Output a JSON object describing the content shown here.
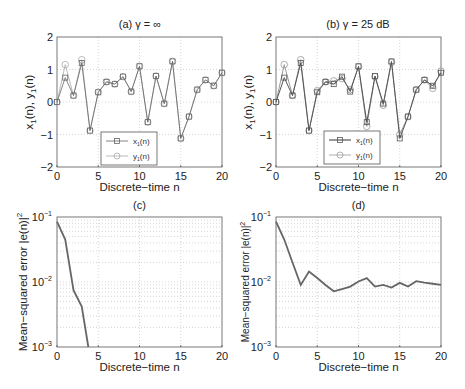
{
  "chart_data": [
    {
      "id": "a",
      "type": "line",
      "title": "(a) γ = ∞",
      "xlabel": "Discrete−time n",
      "ylabel": "x1(n), y1(n)",
      "xlim": [
        0,
        20
      ],
      "ylim": [
        -2,
        2
      ],
      "xticks": [
        0,
        5,
        10,
        15,
        20
      ],
      "yticks": [
        -2,
        -1,
        0,
        1,
        2
      ],
      "grid": true,
      "legend": {
        "position": "lower center",
        "entries": [
          "x1(n)",
          "y1(n)"
        ]
      },
      "x": [
        0,
        1,
        2,
        3,
        4,
        5,
        6,
        7,
        8,
        9,
        10,
        11,
        12,
        13,
        14,
        15,
        16,
        17,
        18,
        19,
        20
      ],
      "series": [
        {
          "name": "x1(n)",
          "marker": "square",
          "color": "#666666",
          "values": [
            0,
            0.75,
            0.2,
            1.2,
            -0.88,
            0.3,
            0.62,
            0.55,
            0.78,
            0.32,
            1.1,
            -0.62,
            0.8,
            -0.05,
            1.25,
            -1.12,
            -0.45,
            0.38,
            0.68,
            0.5,
            0.9
          ]
        },
        {
          "name": "y1(n)",
          "marker": "circle",
          "color": "#aaaaaa",
          "values": [
            0,
            1.15,
            0.2,
            1.3,
            -0.88,
            0.3,
            0.62,
            0.55,
            0.78,
            0.32,
            1.1,
            -0.62,
            0.8,
            -0.05,
            1.25,
            -1.12,
            -0.45,
            0.38,
            0.68,
            0.5,
            0.9
          ]
        }
      ]
    },
    {
      "id": "b",
      "type": "line",
      "title": "(b) γ = 25 dB",
      "xlabel": "Discrete−time n",
      "ylabel": "x1(n), y1(n)",
      "xlim": [
        0,
        20
      ],
      "ylim": [
        -2,
        2
      ],
      "xticks": [
        0,
        5,
        10,
        15,
        20
      ],
      "yticks": [
        -2,
        -1,
        0,
        1,
        2
      ],
      "grid": true,
      "legend": {
        "position": "lower center",
        "entries": [
          "x1(n)",
          "y1(n)"
        ]
      },
      "x": [
        0,
        1,
        2,
        3,
        4,
        5,
        6,
        7,
        8,
        9,
        10,
        11,
        12,
        13,
        14,
        15,
        16,
        17,
        18,
        19,
        20
      ],
      "series": [
        {
          "name": "x1(n)",
          "marker": "square",
          "color": "#555555",
          "values": [
            0,
            0.75,
            0.2,
            1.2,
            -0.88,
            0.3,
            0.62,
            0.55,
            0.78,
            0.32,
            1.1,
            -0.62,
            0.8,
            -0.05,
            1.25,
            -1.12,
            -0.45,
            0.38,
            0.68,
            0.5,
            0.9
          ]
        },
        {
          "name": "y1(n)",
          "marker": "circle",
          "color": "#999999",
          "values": [
            0,
            1.15,
            0.2,
            1.3,
            -0.88,
            0.35,
            0.62,
            0.65,
            0.72,
            0.38,
            1.08,
            -0.75,
            0.78,
            -0.1,
            1.22,
            -1.0,
            -0.45,
            0.38,
            0.68,
            0.42,
            0.95
          ]
        }
      ]
    },
    {
      "id": "c",
      "type": "line",
      "title": "(c)",
      "xlabel": "Discrete−time n",
      "ylabel": "Mean−squared error |e(n)|²",
      "xlim": [
        0,
        20
      ],
      "ylim": [
        0.001,
        0.1
      ],
      "yscale": "log",
      "xticks": [
        0,
        5,
        10,
        15,
        20
      ],
      "yticks": [
        "10^-3",
        "10^-2",
        "10^-1"
      ],
      "grid": true,
      "x": [
        0,
        1,
        2,
        3,
        3.8
      ],
      "series": [
        {
          "name": "MSE",
          "color": "#666666",
          "values": [
            0.085,
            0.045,
            0.0075,
            0.0042,
            0.001
          ]
        }
      ]
    },
    {
      "id": "d",
      "type": "line",
      "title": "(d)",
      "xlabel": "Discrete−time n",
      "ylabel": "Mean−squared error |e(n)|²",
      "xlim": [
        0,
        20
      ],
      "ylim": [
        0.001,
        0.1
      ],
      "yscale": "log",
      "xticks": [
        0,
        5,
        10,
        15,
        20
      ],
      "yticks": [
        "10^-3",
        "10^-2",
        "10^-1"
      ],
      "grid": true,
      "x": [
        0,
        1,
        2,
        3,
        4,
        5,
        6,
        7,
        8,
        9,
        10,
        11,
        12,
        13,
        14,
        15,
        16,
        17,
        18,
        19,
        20
      ],
      "series": [
        {
          "name": "MSE",
          "color": "#666666",
          "values": [
            0.085,
            0.045,
            0.02,
            0.009,
            0.0145,
            0.0115,
            0.009,
            0.0072,
            0.0078,
            0.0085,
            0.0102,
            0.0115,
            0.0085,
            0.009,
            0.0082,
            0.0097,
            0.0085,
            0.0103,
            0.0098,
            0.0094,
            0.009
          ]
        }
      ]
    }
  ],
  "panels": {
    "a": {
      "title": "(a) γ = ∞",
      "xlabel": "Discrete−time n",
      "ylabel": "x",
      "ysub": "1",
      "ymid": "(n), y",
      "yend": "(n)",
      "legend": [
        "x",
        "y"
      ],
      "legend_sub": "1",
      "legend_suffix": "(n)"
    },
    "b": {
      "title": "(b) γ = 25 dB",
      "xlabel": "Discrete−time n",
      "legend": [
        "x",
        "y"
      ],
      "legend_sub": "1",
      "legend_suffix": "(n)"
    },
    "c": {
      "title": "(c)",
      "xlabel": "Discrete−time n",
      "ylabel": "Mean−squared error |e(n)|"
    },
    "d": {
      "title": "(d)",
      "xlabel": "Discrete−time n",
      "ylabel": "Mean−squared error |e(n)|"
    }
  },
  "ticks": {
    "x": [
      "0",
      "5",
      "10",
      "15",
      "20"
    ],
    "y_lin": [
      "2",
      "1",
      "0",
      "−1",
      "−2"
    ],
    "y_log_base": "10",
    "y_log_exp": [
      "−1",
      "−2",
      "−3"
    ]
  }
}
